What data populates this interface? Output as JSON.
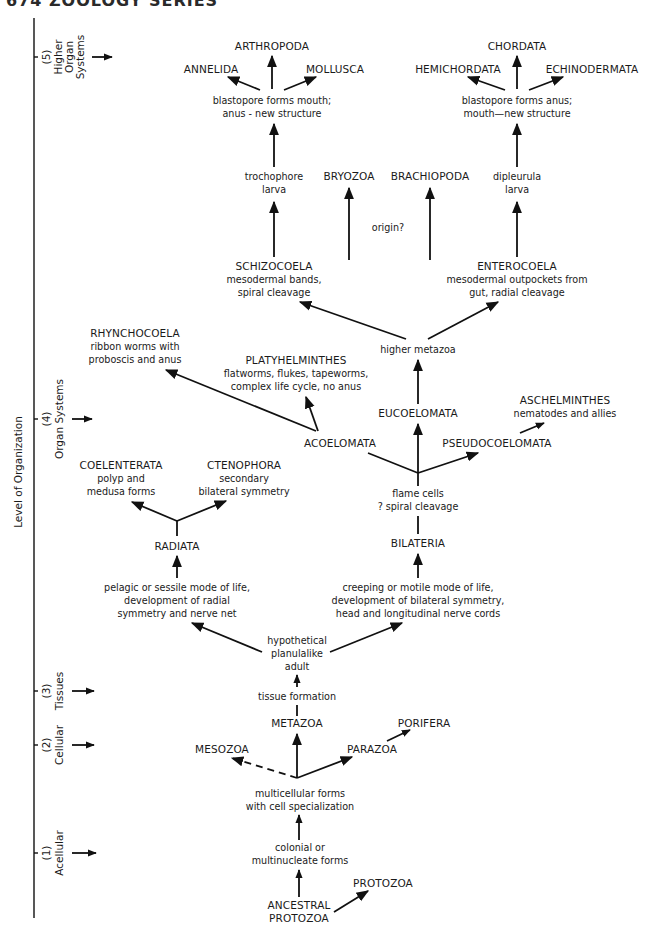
{
  "header": {
    "text": "674 ZOOLOGY SERIES"
  },
  "axis": {
    "label": "Level of Organization",
    "levels": [
      {
        "num": "(5)",
        "lines": [
          "Higher",
          "Organ",
          "Systems"
        ]
      },
      {
        "num": "(4)",
        "lines": [
          "Organ Systems"
        ]
      },
      {
        "num": "(3)",
        "lines": [
          "Tissues"
        ]
      },
      {
        "num": "(2)",
        "lines": [
          "Cellular"
        ]
      },
      {
        "num": "(1)",
        "lines": [
          "Acellular"
        ]
      }
    ]
  },
  "nodes": {
    "arthropoda": "ARTHROPODA",
    "annelida": "ANNELIDA",
    "mollusca": "MOLLUSCA",
    "protostome_note": [
      "blastopore forms mouth;",
      "anus - new structure"
    ],
    "chordata": "CHORDATA",
    "hemichordata": "HEMICHORDATA",
    "echinodermata": "ECHINODERMATA",
    "deuterostome_note": [
      "blastopore forms anus;",
      "mouth—new structure"
    ],
    "trochophore": [
      "trochophore",
      "larva"
    ],
    "bryozoa": "BRYOZOA",
    "brachiopoda": "BRACHIOPODA",
    "origin": "origin?",
    "dipleurula": [
      "dipleurula",
      "larva"
    ],
    "schizocoela": {
      "title": "SCHIZOCOELA",
      "desc": [
        "mesodermal bands,",
        "spiral cleavage"
      ]
    },
    "enterocoela": {
      "title": "ENTEROCOELA",
      "desc": [
        "mesodermal outpockets from",
        "gut, radial cleavage"
      ]
    },
    "higher_metazoa": "higher metazoa",
    "rhynchocoela": {
      "title": "RHYNCHOCOELA",
      "desc": [
        "ribbon worms with",
        "proboscis and anus"
      ]
    },
    "platyhelminthes": {
      "title": "PLATYHELMINTHES",
      "desc": [
        "flatworms, flukes, tapeworms,",
        "complex life cycle, no anus"
      ]
    },
    "eucoelomata": "EUCOELOMATA",
    "aschelminthes": {
      "title": "ASCHELMINTHES",
      "desc": [
        "nematodes and allies"
      ]
    },
    "acoelomata": "ACOELOMATA",
    "pseudocoelomata": "PSEUDOCOELOMATA",
    "coelenterata": {
      "title": "COELENTERATA",
      "desc": [
        "polyp and",
        "medusa forms"
      ]
    },
    "ctenophora": {
      "title": "CTENOPHORA",
      "desc": [
        "secondary",
        "bilateral symmetry"
      ]
    },
    "flame_cells": [
      "flame cells",
      "? spiral cleavage"
    ],
    "radiata": "RADIATA",
    "bilateria": "BILATERIA",
    "radiata_note": [
      "pelagic or sessile mode of life,",
      "development of radial",
      "symmetry and nerve net"
    ],
    "bilateria_note": [
      "creeping or motile mode of life,",
      "development of bilateral symmetry,",
      "head and longitudinal nerve cords"
    ],
    "planula": [
      "hypothetical",
      "planulalike",
      "adult"
    ],
    "tissue_formation": "tissue formation",
    "metazoa": "METAZOA",
    "porifera": "PORIFERA",
    "mesozoa": "MESOZOA",
    "parazoa": "PARAZOA",
    "multicellular": [
      "multicellular forms",
      "with cell specialization"
    ],
    "colonial": [
      "colonial or",
      "multinucleate forms"
    ],
    "protozoa": "PROTOZOA",
    "ancestral": [
      "ANCESTRAL",
      "PROTOZOA"
    ]
  }
}
